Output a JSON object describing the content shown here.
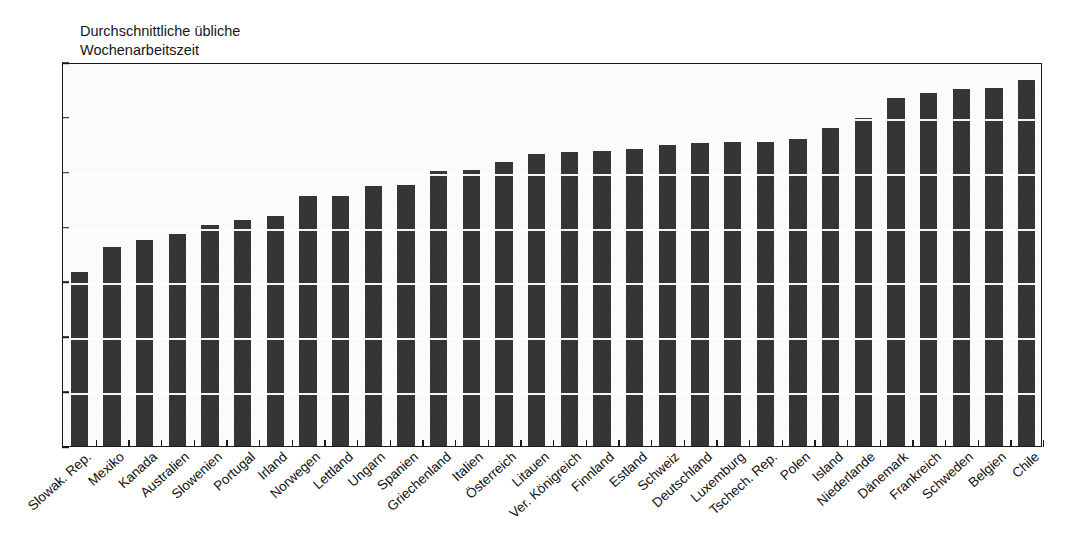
{
  "figure": {
    "cut_title_remnant": "",
    "series_note": "Durchschnittliche übliche\nWochenarbeitszeit"
  },
  "chart_data": {
    "type": "bar",
    "title": "",
    "subtitle": "Durchschnittliche übliche Wochenarbeitszeit",
    "xlabel": "",
    "ylabel": "",
    "ylim": [
      0,
      35
    ],
    "yticks": [
      0,
      5,
      10,
      15,
      20,
      25,
      30,
      35
    ],
    "grid": true,
    "grid_axis": "y",
    "legend": false,
    "bar_color": "#2b2b2b",
    "categories": [
      "Slowak. Rep.",
      "Mexiko",
      "Kanada",
      "Australien",
      "Slowenien",
      "Portugal",
      "Irland",
      "Norwegen",
      "Lettland",
      "Ungarn",
      "Spanien",
      "Griechenland",
      "Italien",
      "Österreich",
      "Litauen",
      "Ver. Königreich",
      "Finnland",
      "Estland",
      "Schweiz",
      "Deutschland",
      "Luxemburg",
      "Tschech. Rep.",
      "Polen",
      "Island",
      "Niederlande",
      "Dänemark",
      "Frankreich",
      "Schweden",
      "Belgien",
      "Chile"
    ],
    "values": [
      15.9,
      18.1,
      18.8,
      19.3,
      20.1,
      20.6,
      21.0,
      22.8,
      22.8,
      23.7,
      23.8,
      25.1,
      25.2,
      25.9,
      26.6,
      26.8,
      26.9,
      27.1,
      27.4,
      27.6,
      27.7,
      27.7,
      28.0,
      29.0,
      29.9,
      31.7,
      32.2,
      32.5,
      32.6,
      33.4
    ]
  }
}
